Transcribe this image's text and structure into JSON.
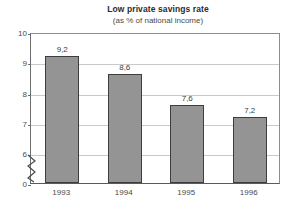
{
  "chart_data": {
    "type": "bar",
    "title": "Low private savings rate",
    "subtitle": "(as % of national income)",
    "xlabel": "",
    "ylabel": "",
    "categories": [
      "1993",
      "1994",
      "1995",
      "1996"
    ],
    "values": [
      9.2,
      8.6,
      7.6,
      7.2
    ],
    "value_labels": [
      "9,2",
      "8,6",
      "7,6",
      "7,2"
    ],
    "ytick_labels": [
      "10",
      "9",
      "8",
      "7",
      "6",
      "0"
    ],
    "ytick_values": [
      10,
      9,
      8,
      7,
      6,
      0
    ],
    "ylim": [
      6,
      10
    ],
    "axis_break": true,
    "axis_break_icon": "zigzag-axis-break-icon",
    "grid": true,
    "grid_axis": "y",
    "legend": false,
    "legend_position": "none",
    "colors": {
      "bar_fill": "#949494",
      "bar_border": "#3d3d3d",
      "gridline": "#c9c9c9",
      "axis": "#5a5a5a",
      "background": "#ffffff",
      "text": "#3a3a3a"
    }
  }
}
